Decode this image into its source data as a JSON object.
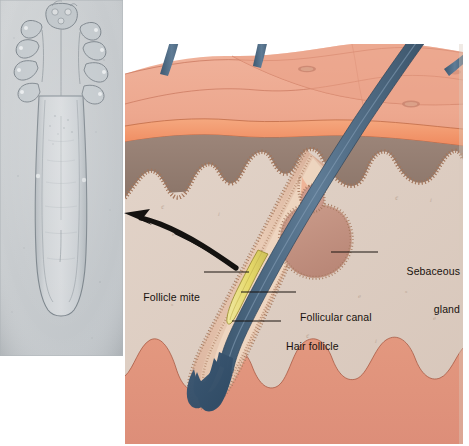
{
  "figure": {
    "kind": "anatomical-illustration",
    "background_color": "#ffffff",
    "width": 469,
    "height": 446
  },
  "micrograph": {
    "name": "follicle-mite-micrograph",
    "description": "Light micrograph of a Demodex follicle mite, elongated worm-like body with four pairs of stubby legs near the head",
    "background_color": "#c9cdd0",
    "specimen_color": "#b9bfc4",
    "outline_color": "#7c858c",
    "frame": {
      "x": 0,
      "y": 0,
      "width": 123,
      "height": 356
    }
  },
  "labels": [
    {
      "id": "sebaceous-gland",
      "text_line1": "Sebaceous",
      "text_line2": "gland",
      "align": "right",
      "x": 381,
      "y": 241,
      "leader": {
        "x1": 378,
        "y1": 252,
        "x2": 331,
        "y2": 252
      }
    },
    {
      "id": "follicular-canal",
      "text_line1": "Follicular canal",
      "text_line2": "",
      "align": "left",
      "x": 300,
      "y": 287,
      "leader": {
        "x1": 296,
        "y1": 292,
        "x2": 241,
        "y2": 292
      }
    },
    {
      "id": "hair-follicle",
      "text_line1": "Hair follicle",
      "text_line2": "",
      "align": "left",
      "x": 286,
      "y": 316,
      "leader": {
        "x1": 281,
        "y1": 321,
        "x2": 232,
        "y2": 321
      }
    },
    {
      "id": "follicle-mite",
      "text_line1": "Follicle mite",
      "text_line2": "",
      "align": "right",
      "x": 140,
      "y": 267,
      "leader": {
        "x1": 204,
        "y1": 272,
        "x2": 249,
        "y2": 272
      }
    }
  ],
  "callout_arrow": {
    "name": "mite-magnification-arrow",
    "description": "Thick curved black arrow pointing from the follicle mite toward the micrograph",
    "color": "#141210"
  },
  "colors": {
    "epidermis_surface": "#edab92",
    "epidermis_shadow": "#e39a80",
    "stratum_band": "#f08e63",
    "stratum_band_light": "#f5a87f",
    "papillary_layer": "#9a8378",
    "papillary_layer_dark": "#8c766c",
    "dermis": "#ddcec3",
    "dermis_edge": "#c9b7aa",
    "hypodermis": "#e0937e",
    "sebaceous_gland": "#c49484",
    "follicle_sheath": "#d6ab97",
    "follicle_sheath_inner": "#e7c3ad",
    "hair_shaft": "#56718c",
    "hair_shaft_dark": "#3f5a74",
    "hair_bulb": "#3e5c78",
    "mite_yellow": "#e8dd77",
    "beaded_outline": "#a3765c",
    "leader_line": "#1a1510",
    "label_text": "#18120e"
  },
  "skin_layers": [
    {
      "name": "epidermis",
      "label_shown": false
    },
    {
      "name": "dermis",
      "label_shown": false
    },
    {
      "name": "hypodermis",
      "label_shown": false
    }
  ],
  "hair_shafts": [
    {
      "id": "hair-shaft-1",
      "position": "upper-left"
    },
    {
      "id": "hair-shaft-2",
      "position": "upper-center"
    },
    {
      "id": "hair-shaft-3",
      "position": "main-diagonal"
    },
    {
      "id": "hair-shaft-4",
      "position": "upper-right-edge"
    }
  ]
}
